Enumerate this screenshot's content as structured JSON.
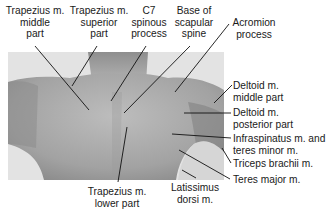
{
  "figure": {
    "colors": {
      "photo_background": "#e3e3e3",
      "skin_light": "#b9b9b9",
      "skin_dark": "#8f8f8f",
      "leader_line": "#111111"
    }
  },
  "labels": {
    "trapezius_middle": [
      "Trapezius m.",
      "middle",
      "part"
    ],
    "trapezius_superior": [
      "Trapezius m.",
      "superior",
      "part"
    ],
    "c7_spinous": [
      "C7",
      "spinous",
      "process"
    ],
    "base_scapular_spine": [
      "Base of",
      "scapular",
      "spine"
    ],
    "acromion": [
      "Acromion",
      "process"
    ],
    "deltoid_middle": [
      "Deltoid m.",
      "middle part"
    ],
    "deltoid_posterior": [
      "Deltoid m.",
      "posterior part"
    ],
    "infraspinatus": [
      "Infraspinatus m. and",
      "teres minor m."
    ],
    "triceps": [
      "Triceps brachii m."
    ],
    "teres_major": [
      "Teres major m."
    ],
    "trapezius_lower": [
      "Trapezius m.",
      "lower part"
    ],
    "latissimus": [
      "Latissimus",
      "dorsi m."
    ]
  }
}
